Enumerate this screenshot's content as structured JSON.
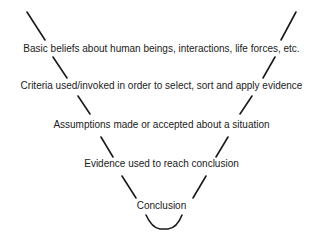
{
  "diagram": {
    "type": "funnel",
    "levels": [
      {
        "label": "Basic beliefs about human beings, interactions, life forces, etc."
      },
      {
        "label": "Criteria used/invoked in order to select, sort and apply evidence"
      },
      {
        "label": "Assumptions made or accepted about a situation"
      },
      {
        "label": "Evidence used to reach conclusion"
      },
      {
        "label": "Conclusion"
      }
    ],
    "line_color": "#1a1a1a"
  }
}
